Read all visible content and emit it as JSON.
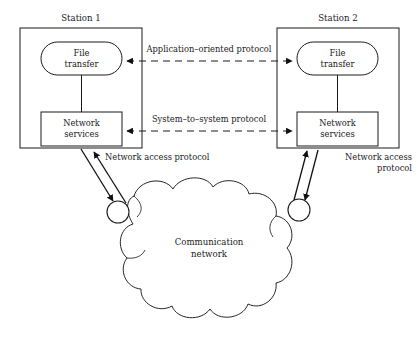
{
  "diagram": {
    "stations": [
      {
        "id": "station-1",
        "label": "Station 1",
        "file_transfer_label_line1": "File",
        "file_transfer_label_line2": "transfer",
        "network_services_label_line1": "Network",
        "network_services_label_line2": "services",
        "access_protocol_label_line1": "Network access protocol",
        "access_protocol_label_line2": ""
      },
      {
        "id": "station-2",
        "label": "Station 2",
        "file_transfer_label_line1": "File",
        "file_transfer_label_line2": "transfer",
        "network_services_label_line1": "Network",
        "network_services_label_line2": "services",
        "access_protocol_label_line1": "Network access",
        "access_protocol_label_line2": "protocol"
      }
    ],
    "protocols": [
      {
        "id": "application-oriented-protocol",
        "label": "Application–oriented protocol",
        "style": "dashed-bidirectional"
      },
      {
        "id": "system-to-system-protocol",
        "label": "System–to–system protocol",
        "style": "dashed-bidirectional"
      }
    ],
    "cloud": {
      "id": "communication-network",
      "label_line1": "Communication",
      "label_line2": "network"
    },
    "colors": {
      "stroke": "#1a1a1a",
      "background": "#ffffff",
      "text": "#1a1a1a"
    }
  }
}
